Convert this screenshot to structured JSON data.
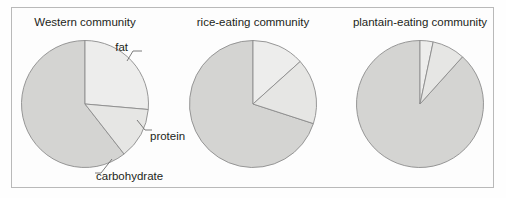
{
  "figure": {
    "background_color": "#fdfdfd",
    "frame_color": "#b9b9b9",
    "slice_outline_color": "#8c8c8c",
    "leader_color": "#6d6d6d",
    "text_color": "#231f20"
  },
  "chart_data": {
    "type": "pie",
    "title": "",
    "legend_position": "annotated-callouts",
    "slice_names": [
      "fat",
      "protein",
      "carbohydrate"
    ],
    "slice_colors": [
      "#ededec",
      "#e6e6e4",
      "#d4d4d2"
    ],
    "charts": [
      {
        "title": "Western community",
        "categories": [
          "fat",
          "protein",
          "carbohydrate"
        ],
        "values": [
          26.4,
          13.1,
          60.5
        ],
        "start_angles_deg": [
          0,
          95,
          142
        ],
        "end_angles_deg": [
          95,
          142,
          360
        ],
        "annotations": [
          {
            "label": "fat",
            "target_angle_deg": 42
          },
          {
            "label": "protein",
            "target_angle_deg": 118
          },
          {
            "label": "carbohydrate",
            "target_angle_deg": 158
          }
        ]
      },
      {
        "title": "rice-eating community",
        "categories": [
          "fat",
          "protein",
          "carbohydrate"
        ],
        "values": [
          13.3,
          16.7,
          70.0
        ],
        "start_angles_deg": [
          0,
          48,
          108
        ],
        "end_angles_deg": [
          48,
          108,
          360
        ],
        "annotations": []
      },
      {
        "title": "plantain-eating community",
        "categories": [
          "fat",
          "protein",
          "carbohydrate"
        ],
        "values": [
          3.3,
          8.3,
          88.4
        ],
        "start_angles_deg": [
          0,
          12,
          42
        ],
        "end_angles_deg": [
          12,
          42,
          360
        ],
        "annotations": []
      }
    ]
  },
  "labels": {
    "fat": "fat",
    "protein": "protein",
    "carbohydrate": "carbohydrate"
  },
  "titles": {
    "chart1": "Western community",
    "chart2": "rice-eating community",
    "chart3": "plantain-eating community"
  }
}
